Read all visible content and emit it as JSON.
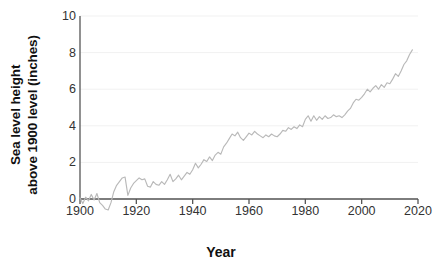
{
  "chart_data": {
    "type": "line",
    "title": "",
    "xlabel": "Year",
    "ylabel": "Sea level height above 1900 level (inches)",
    "ylabel_line1": "Sea level height",
    "ylabel_line2": "above 1900 level (inches)",
    "xlim": [
      1900,
      2020
    ],
    "ylim": [
      0,
      10
    ],
    "xticks": [
      1900,
      1920,
      1940,
      1960,
      1980,
      2000,
      2020
    ],
    "yticks": [
      0,
      2,
      4,
      6,
      8,
      10
    ],
    "grid": "horizontal-faint",
    "legend": "none",
    "line_color": "#b9b9b9",
    "axis_color": "#555555",
    "text_color": "#111111",
    "series": [
      {
        "name": "Sea level height above 1900 level",
        "units": "inches",
        "x": [
          1900,
          1901,
          1902,
          1903,
          1904,
          1905,
          1906,
          1907,
          1908,
          1909,
          1910,
          1911,
          1912,
          1913,
          1914,
          1915,
          1916,
          1917,
          1918,
          1919,
          1920,
          1921,
          1922,
          1923,
          1924,
          1925,
          1926,
          1927,
          1928,
          1929,
          1930,
          1931,
          1932,
          1933,
          1934,
          1935,
          1936,
          1937,
          1938,
          1939,
          1940,
          1941,
          1942,
          1943,
          1944,
          1945,
          1946,
          1947,
          1948,
          1949,
          1950,
          1951,
          1952,
          1953,
          1954,
          1955,
          1956,
          1957,
          1958,
          1959,
          1960,
          1961,
          1962,
          1963,
          1964,
          1965,
          1966,
          1967,
          1968,
          1969,
          1970,
          1971,
          1972,
          1973,
          1974,
          1975,
          1976,
          1977,
          1978,
          1979,
          1980,
          1981,
          1982,
          1983,
          1984,
          1985,
          1986,
          1987,
          1988,
          1989,
          1990,
          1991,
          1992,
          1993,
          1994,
          1995,
          1996,
          1997,
          1998,
          1999,
          2000,
          2001,
          2002,
          2003,
          2004,
          2005,
          2006,
          2007,
          2008,
          2009,
          2010,
          2011,
          2012,
          2013,
          2014,
          2015,
          2016,
          2017,
          2018
        ],
        "values": [
          0.05,
          -0.25,
          0.1,
          -0.1,
          0.25,
          -0.05,
          0.3,
          -0.2,
          -0.35,
          -0.55,
          -0.6,
          -0.2,
          0.4,
          0.75,
          0.95,
          1.15,
          1.2,
          0.2,
          0.6,
          0.85,
          1.0,
          1.15,
          1.05,
          1.1,
          0.7,
          0.65,
          0.95,
          0.8,
          0.75,
          0.95,
          0.8,
          1.05,
          1.35,
          0.95,
          1.1,
          1.3,
          1.05,
          1.25,
          1.45,
          1.35,
          1.6,
          1.95,
          1.7,
          1.9,
          2.15,
          2.05,
          2.3,
          2.1,
          2.4,
          2.55,
          2.45,
          2.85,
          3.05,
          3.3,
          3.55,
          3.45,
          3.65,
          3.35,
          3.2,
          3.4,
          3.6,
          3.5,
          3.7,
          3.55,
          3.45,
          3.35,
          3.5,
          3.4,
          3.55,
          3.45,
          3.4,
          3.55,
          3.75,
          3.7,
          3.9,
          3.8,
          3.95,
          3.85,
          4.05,
          3.95,
          4.35,
          4.55,
          4.25,
          4.55,
          4.3,
          4.5,
          4.35,
          4.55,
          4.4,
          4.45,
          4.6,
          4.5,
          4.55,
          4.45,
          4.6,
          4.8,
          4.95,
          5.25,
          5.45,
          5.4,
          5.55,
          5.75,
          6.0,
          5.85,
          6.05,
          6.2,
          6.0,
          6.25,
          6.1,
          6.35,
          6.3,
          6.55,
          6.85,
          6.7,
          7.0,
          7.35,
          7.55,
          7.9,
          8.15
        ]
      }
    ]
  },
  "axis": {
    "x_title": "Year",
    "y_title_line1": "Sea level height",
    "y_title_line2": "above 1900 level (inches)"
  }
}
